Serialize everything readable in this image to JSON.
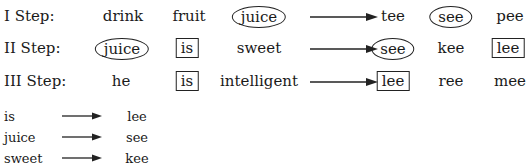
{
  "steps": [
    {
      "label": "I Step:",
      "before": [
        {
          "text": "drink",
          "mark": "none"
        },
        {
          "text": "fruit",
          "mark": "none"
        },
        {
          "text": "juice",
          "mark": "oval"
        }
      ],
      "after": [
        {
          "text": "tee",
          "mark": "none"
        },
        {
          "text": "see",
          "mark": "oval"
        },
        {
          "text": "pee",
          "mark": "none"
        }
      ]
    },
    {
      "label": "II Step:",
      "before": [
        {
          "text": "juice",
          "mark": "oval"
        },
        {
          "text": "is",
          "mark": "box"
        },
        {
          "text": "sweet",
          "mark": "none"
        }
      ],
      "after": [
        {
          "text": "see",
          "mark": "oval"
        },
        {
          "text": "kee",
          "mark": "none"
        },
        {
          "text": "lee",
          "mark": "box"
        }
      ]
    },
    {
      "label": "III Step:",
      "before": [
        {
          "text": "he",
          "mark": "none"
        },
        {
          "text": "is",
          "mark": "box"
        },
        {
          "text": "intelligent",
          "mark": "none"
        }
      ],
      "after": [
        {
          "text": "lee",
          "mark": "box"
        },
        {
          "text": "ree",
          "mark": "none"
        },
        {
          "text": "mee",
          "mark": "none"
        }
      ]
    }
  ],
  "mappings": [
    {
      "from": "is",
      "to": "lee"
    },
    {
      "from": "juice",
      "to": "see"
    },
    {
      "from": "sweet",
      "to": "kee"
    }
  ]
}
